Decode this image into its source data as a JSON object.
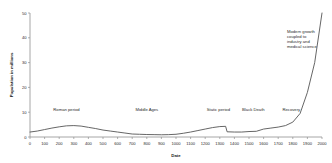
{
  "chart_data": {
    "type": "line",
    "title": "",
    "xlabel": "Date",
    "ylabel": "Population in millions",
    "xlim": [
      0,
      2000
    ],
    "ylim": [
      0,
      50
    ],
    "grid": false,
    "legend": "none",
    "x_ticks": [
      "0",
      "100",
      "200",
      "300",
      "400",
      "500",
      "600",
      "700",
      "800",
      "900",
      "1000",
      "1100",
      "1200",
      "1300",
      "1400",
      "1500",
      "1600",
      "1700",
      "1800",
      "1900",
      "2000"
    ],
    "y_ticks": [
      "0",
      "10",
      "20",
      "30",
      "40",
      "50"
    ],
    "x": [
      0,
      50,
      100,
      150,
      200,
      250,
      300,
      350,
      400,
      450,
      500,
      550,
      600,
      650,
      700,
      750,
      800,
      850,
      900,
      950,
      1000,
      1050,
      1100,
      1150,
      1200,
      1250,
      1300,
      1340,
      1350,
      1400,
      1450,
      1500,
      1550,
      1600,
      1650,
      1700,
      1750,
      1800,
      1850,
      1900,
      1950,
      2000
    ],
    "values": [
      2.0,
      2.4,
      3.0,
      3.6,
      4.1,
      4.5,
      4.6,
      4.4,
      3.9,
      3.4,
      2.8,
      2.4,
      2.0,
      1.6,
      1.2,
      1.1,
      1.0,
      0.95,
      0.9,
      0.95,
      1.1,
      1.5,
      2.0,
      2.6,
      3.2,
      3.8,
      4.2,
      4.3,
      2.1,
      2.0,
      2.0,
      2.2,
      2.3,
      3.2,
      3.6,
      4.0,
      4.6,
      6.0,
      9.5,
      18.0,
      30.0,
      50.0
    ],
    "annotations": [
      {
        "text": "Roman period",
        "x": 250,
        "y": 10.5
      },
      {
        "text": "Middle Ages",
        "x": 800,
        "y": 10.5
      },
      {
        "text": "Static period",
        "x": 1290,
        "y": 10.5
      },
      {
        "text": "Black Death",
        "x": 1530,
        "y": 10.5
      },
      {
        "text": "Recovery",
        "x": 1790,
        "y": 10.5
      }
    ],
    "callout": {
      "lines": [
        "Modern growth",
        "coupled to",
        "industry and",
        "medical science"
      ],
      "x": 1760,
      "y": 42
    }
  },
  "colors": {
    "line": "#555555",
    "axis": "#8f8f8f",
    "text": "#2b2b2b",
    "background": "#ffffff"
  }
}
